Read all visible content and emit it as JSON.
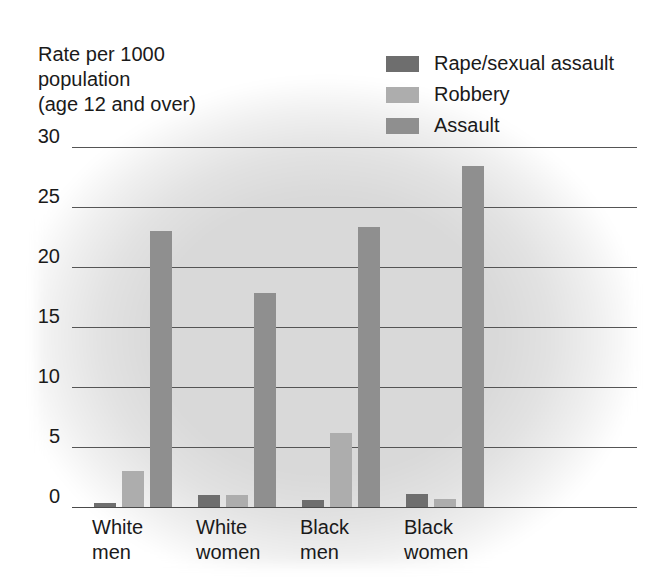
{
  "axis_title": "Rate per 1000\npopulation\n(age 12 and over)",
  "legend": {
    "items": [
      {
        "label": "Rape/sexual assault",
        "color": "#6e6e6e",
        "swatch_name": "legend-swatch-rape-sexual-assault"
      },
      {
        "label": "Robbery",
        "color": "#adadad",
        "swatch_name": "legend-swatch-robbery"
      },
      {
        "label": "Assault",
        "color": "#8f8f8f",
        "swatch_name": "legend-swatch-assault"
      }
    ]
  },
  "chart_data": {
    "type": "bar",
    "title": "",
    "xlabel": "",
    "ylabel": "Rate per 1000 population (age 12 and over)",
    "ylim": [
      0,
      30
    ],
    "yticks": [
      30,
      25,
      20,
      15,
      10,
      5,
      0
    ],
    "grid": true,
    "legend_position": "top-right",
    "categories": [
      "White\nmen",
      "White\nwomen",
      "Black\nmen",
      "Black\nwomen"
    ],
    "series": [
      {
        "name": "Rape/sexual assault",
        "color": "#6e6e6e",
        "values": [
          0.3,
          1.0,
          0.6,
          1.1
        ]
      },
      {
        "name": "Robbery",
        "color": "#adadad",
        "values": [
          3.0,
          1.0,
          6.2,
          0.7
        ]
      },
      {
        "name": "Assault",
        "color": "#8f8f8f",
        "values": [
          23.0,
          17.8,
          23.3,
          28.4
        ]
      }
    ]
  }
}
